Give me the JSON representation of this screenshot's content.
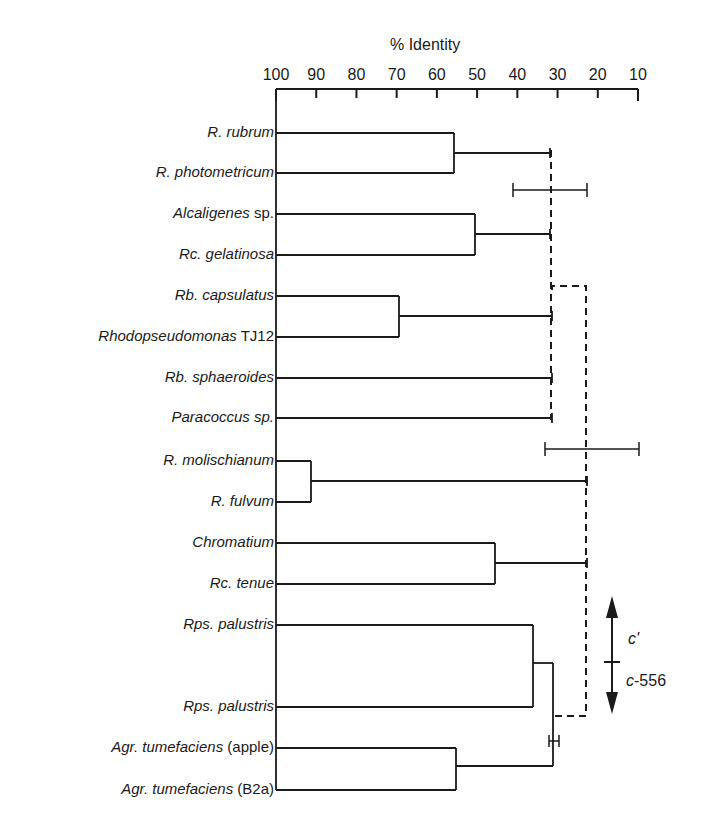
{
  "chart_data": {
    "type": "dendrogram",
    "title": "",
    "xlabel": "% Identity",
    "x_ticks": [
      100,
      90,
      80,
      70,
      60,
      50,
      40,
      30,
      20,
      10
    ],
    "xlim": [
      100,
      10
    ],
    "leaves": [
      {
        "italic": "R.  rubrum",
        "plain": ""
      },
      {
        "italic": "R. photometricum",
        "plain": ""
      },
      {
        "italic": "Alcaligenes",
        "plain": " sp."
      },
      {
        "italic": "Rc. gelatinosa",
        "plain": ""
      },
      {
        "italic": "Rb. capsulatus",
        "plain": ""
      },
      {
        "italic": "Rhodopseudomonas",
        "plain": " TJ12"
      },
      {
        "italic": "Rb. sphaeroides",
        "plain": ""
      },
      {
        "italic": "Paracoccus sp.",
        "plain": ""
      },
      {
        "italic": "R. molischianum",
        "plain": ""
      },
      {
        "italic": "R. fulvum",
        "plain": ""
      },
      {
        "italic": "Chromatium",
        "plain": ""
      },
      {
        "italic": "Rc. tenue",
        "plain": ""
      },
      {
        "italic": "Rps. palustris",
        "plain": ""
      },
      {
        "italic": "Rps. palustris",
        "plain": ""
      },
      {
        "italic": "Agr. tumefaciens",
        "plain": " (apple)"
      },
      {
        "italic": "Agr. tumefaciens",
        "plain": " (B2a)"
      }
    ],
    "nodes": [
      {
        "members": [
          "R. rubrum",
          "R. photometricum"
        ],
        "identity": 55.5
      },
      {
        "members": [
          "Alcaligenes sp.",
          "Rc. gelatinosa"
        ],
        "identity": 50.5
      },
      {
        "members": [
          "Rb. capsulatus",
          "Rhodopseudomonas TJ12"
        ],
        "identity": 69.5
      },
      {
        "members": [
          "R. molischianum",
          "R. fulvum"
        ],
        "identity": 91
      },
      {
        "members": [
          "Chromatium",
          "Rc. tenue"
        ],
        "identity": 45.5
      },
      {
        "members": [
          "Rps. palustris",
          "Rps. palustris"
        ],
        "identity": 36
      },
      {
        "members": [
          "Agr. tumefaciens (apple)",
          "Agr. tumefaciens (B2a)"
        ],
        "identity": 56.5
      },
      {
        "members": [
          "Rps. palustris group",
          "Agr. tumefaciens group"
        ],
        "identity": 31
      },
      {
        "members": [
          "group 1 (R. rubrum ... Paracoccus sp.)"
        ],
        "identity": 31.5,
        "style": "dashed"
      },
      {
        "members": [
          "group 1",
          "R. molischianum group",
          "Chromatium group",
          "Rps/Agr group"
        ],
        "identity": 22.5,
        "style": "dashed"
      }
    ],
    "error_bars": [
      {
        "center": 31.5,
        "low": 40.5,
        "high": 22,
        "position": "between R. photometricum and Alcaligenes"
      },
      {
        "center": 22.5,
        "low": 32.5,
        "high": 9,
        "position": "between Paracoccus and R. molischianum"
      },
      {
        "center": 31,
        "low": 32,
        "high": 29.5,
        "position": "between Rps. palustris and Agr. tumefaciens"
      }
    ],
    "annotations": [
      {
        "text": "c'",
        "direction": "up"
      },
      {
        "text": "c-556",
        "direction": "down"
      }
    ]
  },
  "annotations": {
    "c_prime": "c'",
    "c556_italic": "c",
    "c556_plain": "-556"
  }
}
